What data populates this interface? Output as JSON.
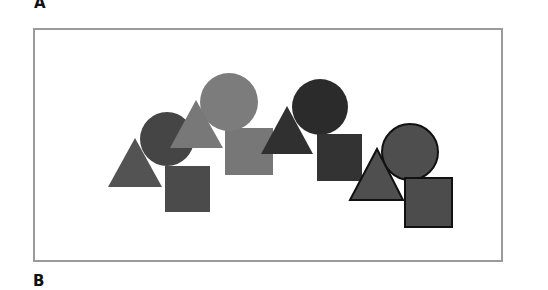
{
  "figure": {
    "panels": [
      {
        "label": "A"
      },
      {
        "label": "B"
      }
    ]
  },
  "diagram": {
    "groups": [
      {
        "name": "group-1",
        "fill": {
          "triangle": "#535353",
          "circle": "#454545",
          "square": "#4b4b4b"
        },
        "outline": "none",
        "triangle": {
          "points": "108,187 135,138 162,187"
        },
        "circle": {
          "cx": 167,
          "cy": 139,
          "r": 27
        },
        "square": {
          "x": 165,
          "y": 166,
          "w": 45,
          "h": 46
        }
      },
      {
        "name": "group-2",
        "fill": {
          "triangle": "#787878",
          "circle": "#7c7c7c",
          "square": "#777777"
        },
        "outline": "none",
        "circle": {
          "cx": 229,
          "cy": 102,
          "r": 29
        },
        "triangle": {
          "points": "170,148 196,100 223,148"
        },
        "square": {
          "x": 225,
          "y": 128,
          "w": 48,
          "h": 47
        }
      },
      {
        "name": "group-3",
        "fill": {
          "triangle": "#303030",
          "circle": "#2b2b2b",
          "square": "#333333"
        },
        "outline": "none",
        "circle": {
          "cx": 320,
          "cy": 107,
          "r": 28
        },
        "triangle": {
          "points": "261,154 287,106 313,154"
        },
        "square": {
          "x": 317,
          "y": 134,
          "w": 45,
          "h": 47
        }
      },
      {
        "name": "group-4",
        "fill": {
          "triangle": "#4f4f4f",
          "circle": "#4e4e4e",
          "square": "#4c4c4c"
        },
        "outline": "#111111",
        "circle": {
          "cx": 410,
          "cy": 152,
          "r": 28
        },
        "triangle": {
          "points": "350,200 377,149 403,200"
        },
        "square": {
          "x": 405,
          "y": 178,
          "w": 47,
          "h": 49
        }
      }
    ]
  }
}
